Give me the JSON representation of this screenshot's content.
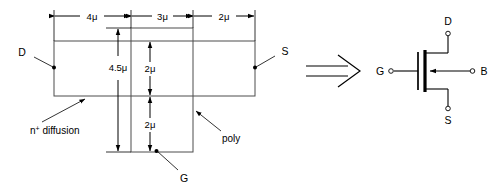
{
  "figure": {
    "layout_view": {
      "name": "layout-view",
      "dimensions": {
        "top_left": "4μ",
        "top_middle": "3μ",
        "top_right": "2μ",
        "left_vertical": "4.5μ",
        "inner_upper": "2μ",
        "inner_lower": "2μ"
      },
      "callouts": {
        "drain": "D",
        "source": "S",
        "gate": "G",
        "diffusion_base": "n",
        "diffusion_sup": "+",
        "diffusion_rest": " diffusion",
        "poly": "poly"
      }
    },
    "implies_symbol": "⟹",
    "symbol_view": {
      "name": "mosfet-symbol",
      "terminals": {
        "drain": "D",
        "gate": "G",
        "source": "S",
        "body": "B"
      }
    },
    "colors": {
      "shape_stroke": "#4d4d4d",
      "dim_stroke": "#000000",
      "background": "#ffffff"
    }
  }
}
